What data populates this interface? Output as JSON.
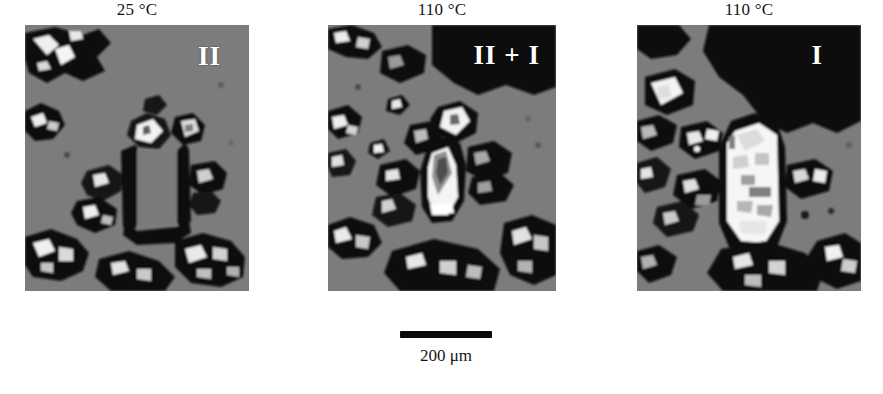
{
  "figure": {
    "type": "micrograph-series",
    "description_kind": "polarized light micrographs of a polymorphic transition",
    "panels": [
      {
        "id": "panel-1",
        "temperature_label": "25 °C",
        "phase_label": "II",
        "phase_label_position": "top-right",
        "background_tone": "#7c7c7c",
        "crystal_appearance": "dark-outlined elongated crystal, non-birefringent interior"
      },
      {
        "id": "panel-2",
        "temperature_label": "110 °C",
        "phase_label": "II + I",
        "phase_label_position": "top-right",
        "background_tone": "#7c7c7c",
        "crystal_appearance": "partially transformed crystal, bright wedge growing from base"
      },
      {
        "id": "panel-3",
        "temperature_label": "110 °C",
        "phase_label": "I",
        "phase_label_position": "top-right",
        "background_tone": "#7c7c7c",
        "crystal_appearance": "fully transformed bright birefringent crystal"
      }
    ],
    "scalebar": {
      "caption": "200 μm",
      "length_px": 92,
      "bar_color": "#0a0a0a"
    },
    "colors": {
      "background": "#ffffff",
      "text": "#151515",
      "label_text": "#ffffff",
      "matrix_gray": "#7c7c7c",
      "dark_regions": "#0d0d0d",
      "bright_regions": "#f2f2f2"
    }
  }
}
